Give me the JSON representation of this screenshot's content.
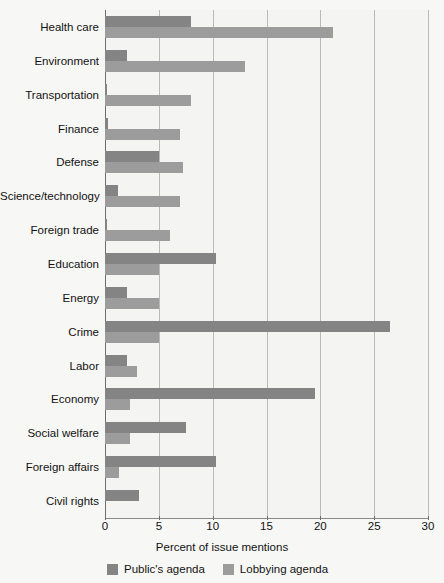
{
  "chart_data": {
    "type": "bar",
    "orientation": "horizontal",
    "title": "",
    "subtitle": "",
    "xlabel": "Percent of issue mentions",
    "ylabel": "",
    "xlim": [
      0,
      30
    ],
    "xticks": [
      0,
      5,
      10,
      15,
      20,
      25,
      30
    ],
    "xtick_labels": [
      "0",
      "5",
      "10",
      "15",
      "20",
      "25",
      "30"
    ],
    "grid": true,
    "grid_axis": "x",
    "legend_position": "bottom-left",
    "categories": [
      "Health care",
      "Environment",
      "Transportation",
      "Finance",
      "Defense",
      "Science/technology",
      "Foreign trade",
      "Education",
      "Energy",
      "Crime",
      "Labor",
      "Economy",
      "Social welfare",
      "Foreign affairs",
      "Civil  rights"
    ],
    "series": [
      {
        "name": "Public's agenda",
        "color": "#848484",
        "values": [
          8.0,
          2.0,
          0.2,
          0.3,
          5.0,
          1.2,
          0.2,
          10.3,
          2.0,
          26.5,
          2.0,
          19.5,
          7.5,
          10.3,
          3.2
        ]
      },
      {
        "name": "Lobbying agenda",
        "color": "#9c9c9c",
        "values": [
          21.2,
          13.0,
          8.0,
          7.0,
          7.2,
          7.0,
          6.0,
          5.0,
          5.0,
          5.0,
          3.0,
          2.3,
          2.3,
          1.3,
          0.0
        ]
      }
    ]
  },
  "legend": {
    "items": [
      {
        "label": "Public's agenda",
        "color": "#848484"
      },
      {
        "label": "Lobbying agenda",
        "color": "#9c9c9c"
      }
    ]
  },
  "axis": {
    "x_title": "Percent of issue mentions"
  }
}
